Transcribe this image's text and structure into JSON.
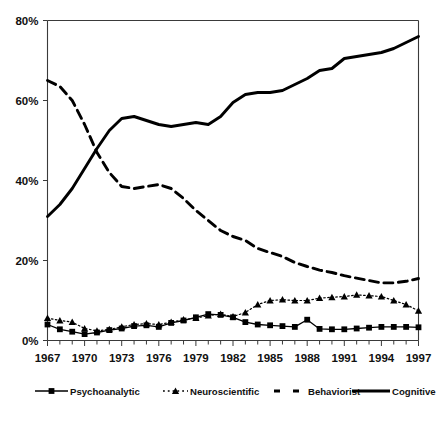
{
  "chart_data": {
    "type": "line",
    "title": "",
    "subtitle": "",
    "xlabel": "",
    "ylabel": "",
    "xlim": [
      1967,
      1997
    ],
    "ylim": [
      0,
      80
    ],
    "grid": false,
    "legend_position": "bottom",
    "x": [
      1967,
      1968,
      1969,
      1970,
      1971,
      1972,
      1973,
      1974,
      1975,
      1976,
      1977,
      1978,
      1979,
      1980,
      1981,
      1982,
      1983,
      1984,
      1985,
      1986,
      1987,
      1988,
      1989,
      1990,
      1991,
      1992,
      1993,
      1994,
      1995,
      1996,
      1997
    ],
    "xtick_labels": [
      "1967",
      "1970",
      "1973",
      "1976",
      "1979",
      "1982",
      "1985",
      "1988",
      "1991",
      "1994",
      "1997"
    ],
    "xtick_values": [
      1967,
      1970,
      1973,
      1976,
      1979,
      1982,
      1985,
      1988,
      1991,
      1994,
      1997
    ],
    "ytick_labels": [
      "0%",
      "20%",
      "40%",
      "60%",
      "80%"
    ],
    "ytick_values": [
      0,
      20,
      40,
      60,
      80
    ],
    "series": [
      {
        "name": "Psychoanalytic",
        "style": "solid-square",
        "marker": "square",
        "color": "#000000",
        "values": [
          4.0,
          2.8,
          2.2,
          1.6,
          2.0,
          2.6,
          3.0,
          3.6,
          3.8,
          3.4,
          4.4,
          5.0,
          5.8,
          6.6,
          6.4,
          5.8,
          4.6,
          4.0,
          3.8,
          3.6,
          3.4,
          5.2,
          2.9,
          2.8,
          2.8,
          3.0,
          3.2,
          3.4,
          3.4,
          3.4,
          3.3
        ]
      },
      {
        "name": "Neuroscientific",
        "style": "dotted-triangle",
        "marker": "triangle",
        "color": "#000000",
        "values": [
          5.6,
          5.0,
          4.6,
          3.0,
          2.4,
          2.8,
          3.4,
          4.0,
          4.2,
          4.0,
          4.6,
          5.2,
          5.6,
          6.2,
          6.6,
          6.0,
          7.0,
          9.0,
          10.0,
          10.2,
          10.0,
          10.0,
          10.6,
          10.8,
          11.0,
          11.4,
          11.2,
          11.0,
          10.0,
          9.0,
          7.4
        ]
      },
      {
        "name": "Behaviorist",
        "style": "dashed",
        "marker": "none",
        "color": "#000000",
        "values": [
          65.0,
          63.5,
          60.0,
          54.0,
          47.0,
          42.0,
          38.5,
          38.0,
          38.5,
          39.0,
          38.0,
          35.5,
          32.5,
          30.0,
          27.5,
          26.0,
          25.0,
          23.0,
          22.0,
          21.0,
          19.5,
          18.5,
          17.6,
          17.0,
          16.2,
          15.6,
          15.0,
          14.4,
          14.4,
          14.8,
          15.5
        ]
      },
      {
        "name": "Cognitive",
        "style": "solid-thick",
        "marker": "none",
        "color": "#000000",
        "values": [
          31.0,
          34.0,
          38.0,
          43.0,
          48.0,
          52.5,
          55.5,
          56.0,
          55.0,
          54.0,
          53.5,
          54.0,
          54.5,
          54.0,
          56.0,
          59.5,
          61.5,
          62.0,
          62.0,
          62.5,
          64.0,
          65.5,
          67.5,
          68.0,
          70.5,
          71.0,
          71.5,
          72.0,
          73.0,
          74.5,
          76.0
        ]
      }
    ],
    "legend": [
      {
        "label": "Psychoanalytic",
        "style": "solid-square",
        "marker": "square"
      },
      {
        "label": "Neuroscientific",
        "style": "dotted-triangle",
        "marker": "triangle"
      },
      {
        "label": "Behaviorist",
        "style": "dashed",
        "marker": "none"
      },
      {
        "label": "Cognitive",
        "style": "solid-thick",
        "marker": "none"
      }
    ]
  },
  "colors": {
    "ink": "#000000",
    "axis": "#3a3a3a",
    "background": "#ffffff"
  }
}
